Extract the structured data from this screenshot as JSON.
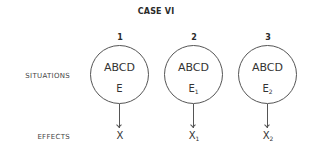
{
  "title": "CASE VI",
  "row_labels": {
    "situations": "SITUATIONS",
    "effects": "EFFECTS"
  },
  "cases": [
    {
      "number": "1",
      "situation": "ABCD",
      "variable": "E",
      "variable_sub": "",
      "effect": "X",
      "effect_sub": ""
    },
    {
      "number": "2",
      "situation": "ABCD",
      "variable": "E",
      "variable_sub": "1",
      "effect": "X",
      "effect_sub": "1"
    },
    {
      "number": "3",
      "situation": "ABCD",
      "variable": "E",
      "variable_sub": "2",
      "effect": "X",
      "effect_sub": "2"
    }
  ]
}
